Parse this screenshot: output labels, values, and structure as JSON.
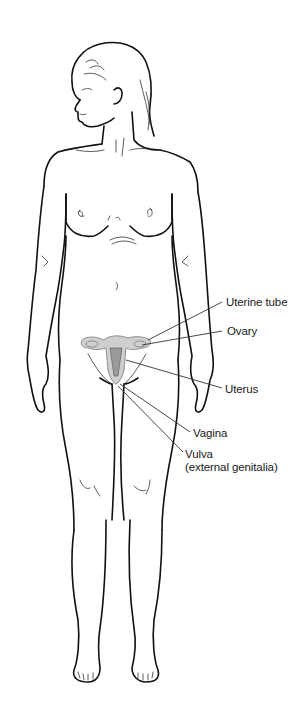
{
  "diagram": {
    "labels": [
      {
        "id": "uterine-tube",
        "text": "Uterine tube",
        "x": 226,
        "y": 296
      },
      {
        "id": "ovary",
        "text": "Ovary",
        "x": 227,
        "y": 325
      },
      {
        "id": "uterus",
        "text": "Uterus",
        "x": 225,
        "y": 383
      },
      {
        "id": "vagina",
        "text": "Vagina",
        "x": 193,
        "y": 427
      },
      {
        "id": "vulva",
        "text": "Vulva",
        "x": 185,
        "y": 448
      },
      {
        "id": "vulva-sub",
        "text": "(external genitalia)",
        "x": 185,
        "y": 461
      }
    ],
    "colors": {
      "line": "#111111",
      "organ_fill": "#cfcfcf",
      "organ_dark": "#9a9a9a",
      "background": "#ffffff"
    }
  }
}
